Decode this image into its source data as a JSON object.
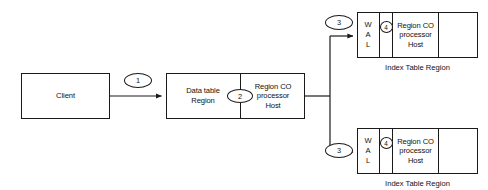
{
  "diagram": {
    "colors": {
      "stroke": "#1a1a1a",
      "text": "#111111",
      "background": "#ffffff"
    },
    "nodes": {
      "client": {
        "label": "Client"
      },
      "data_region_server": {
        "left_cell": "Data table\nRegion",
        "right_cell": "Region CO\nprocessor\nHost",
        "divider_badge": "2"
      },
      "index_region_top": {
        "wal_letters": [
          "W",
          "A",
          "L"
        ],
        "badge": "4",
        "processor_cell": "Region CO\nprocessor\nHost",
        "empty_cell": "",
        "caption": "Index Table Region",
        "inbound_badge": "3"
      },
      "index_region_bottom": {
        "wal_letters": [
          "W",
          "A",
          "L"
        ],
        "badge": "4",
        "processor_cell": "Region CO\nprocessor\nHost",
        "empty_cell": "",
        "caption": "Index Table Region",
        "inbound_badge": "3"
      }
    },
    "edges": {
      "client_to_data_region": {
        "badge": "1"
      }
    }
  }
}
